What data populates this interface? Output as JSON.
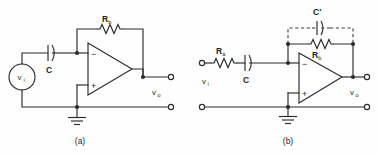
{
  "figure": {
    "background_color": "#fefefe",
    "line_color": "#2b2b2b",
    "width": 378,
    "height": 155,
    "panels": [
      {
        "id": "a",
        "caption": "(a)",
        "description": "Inverting op-amp amplifier with series input capacitor C and feedback resistor Rb, driven by voltage source vi",
        "labels": {
          "source": "v",
          "source_sub": "i",
          "capacitor": "C",
          "feedback_resistor": "R",
          "feedback_resistor_sub": "b",
          "output": "v",
          "output_sub": "o",
          "inverting_sign": "−",
          "noninverting_sign": "+"
        }
      },
      {
        "id": "b",
        "caption": "(b)",
        "description": "Inverting op-amp amplifier with input resistor Ra in series with capacitor C, feedback resistor Rb and optional dashed feedback capacitor C prime",
        "labels": {
          "input_resistor": "R",
          "input_resistor_sub": "a",
          "capacitor": "C",
          "feedback_resistor": "R",
          "feedback_resistor_sub": "b",
          "feedback_capacitor": "C′",
          "input": "v",
          "input_sub": "i",
          "output": "v",
          "output_sub": "o",
          "inverting_sign": "−",
          "noninverting_sign": "+"
        }
      }
    ]
  }
}
